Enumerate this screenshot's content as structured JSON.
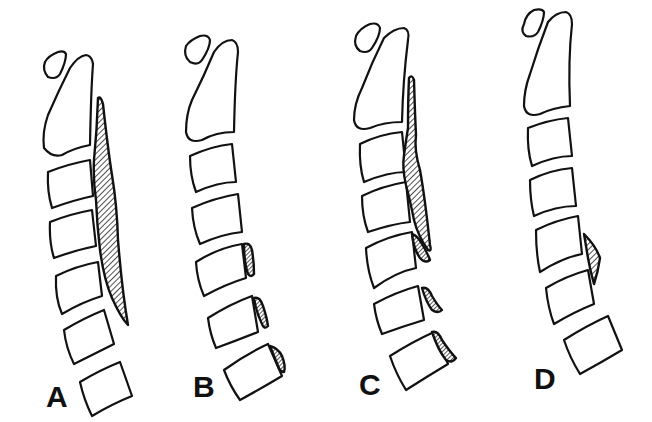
{
  "figure": {
    "type": "line-drawing",
    "background_color": "#ffffff",
    "line_color": "#111111",
    "panels": [
      {
        "id": "A",
        "label": "A",
        "lesion": "long continuous hatched band along posterior vertebral bodies from C2 to C5"
      },
      {
        "id": "B",
        "label": "B",
        "lesion": "small segmental hatched regions at posterior margins of lower vertebrae"
      },
      {
        "id": "C",
        "label": "C",
        "lesion": "continuous upper band plus segmental lower hatched regions (mixed)"
      },
      {
        "id": "D",
        "label": "D",
        "lesion": "small localized hatched region bridging one disc space"
      }
    ]
  }
}
